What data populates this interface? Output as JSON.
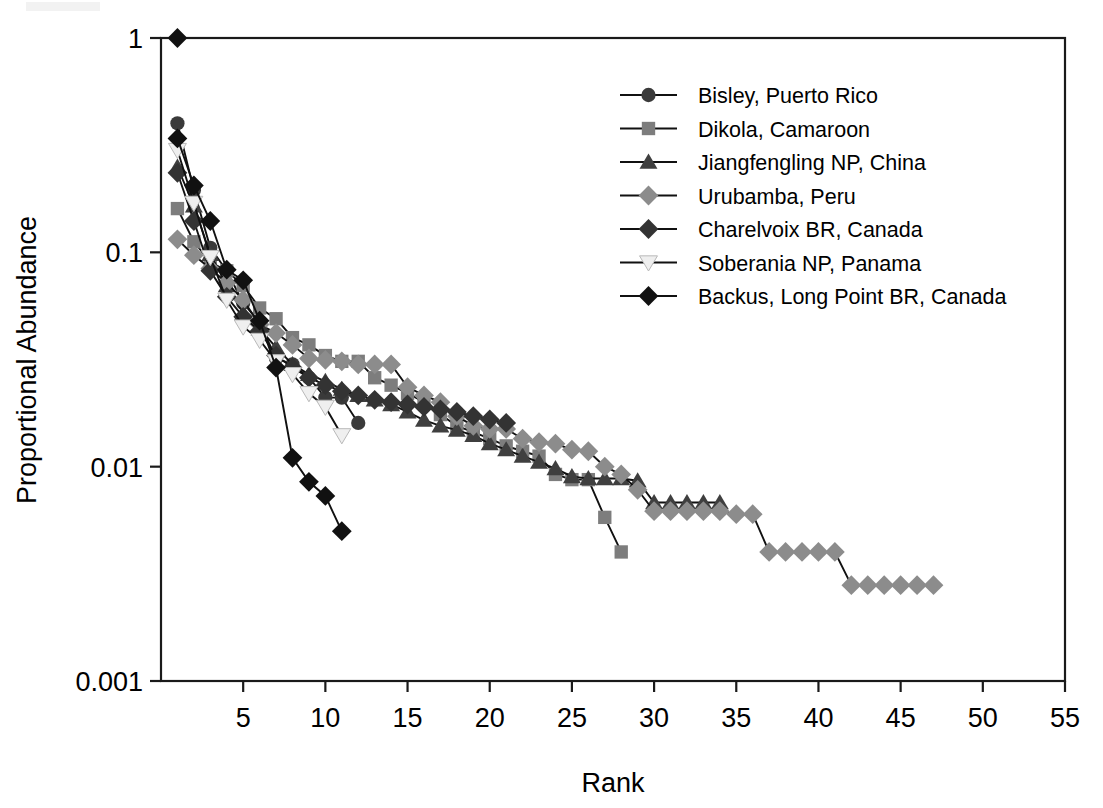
{
  "figure": {
    "width": 1103,
    "height": 808,
    "background": "#ffffff"
  },
  "axes": {
    "x": {
      "title": "Rank",
      "ticks": [
        5,
        10,
        15,
        20,
        25,
        30,
        35,
        40,
        45,
        50,
        55
      ],
      "tick_labels": [
        "5",
        "10",
        "15",
        "20",
        "25",
        "30",
        "35",
        "40",
        "45",
        "50",
        "55"
      ],
      "min": 0,
      "max": 55,
      "scale": "linear"
    },
    "y": {
      "title": "Proportional Abundance",
      "ticks": [
        1,
        0.1,
        0.01,
        0.001
      ],
      "tick_labels": [
        "1",
        "0.1",
        "0.01",
        "0.001"
      ],
      "min": 0.001,
      "max": 1,
      "scale": "log"
    },
    "grid": false,
    "frame": true,
    "frame_color": "#1a1a1a"
  },
  "legend": {
    "position": "top-right",
    "entries": [
      {
        "label": "Bisley, Puerto Rico",
        "marker": "circle",
        "color": "#3a3a3a"
      },
      {
        "label": "Dikola, Camaroon",
        "marker": "square",
        "color": "#7d7d7d"
      },
      {
        "label": "Jiangfengling NP, China",
        "marker": "triangle-up",
        "color": "#3f3f3f"
      },
      {
        "label": "Urubamba, Peru",
        "marker": "diamond",
        "color": "#8c8c8c"
      },
      {
        "label": "Charelvoix BR, Canada",
        "marker": "diamond",
        "color": "#333333"
      },
      {
        "label": "Soberania NP, Panama",
        "marker": "triangle-down",
        "color": "#efefef"
      },
      {
        "label": "Backus, Long Point BR, Canada",
        "marker": "diamond",
        "color": "#111111"
      }
    ]
  },
  "chart_data": {
    "type": "line",
    "title": "",
    "xlabel": "Rank",
    "ylabel": "Proportional Abundance",
    "xlim": [
      0,
      55
    ],
    "ylim": [
      0.001,
      1
    ],
    "yscale": "log",
    "grid": false,
    "legend_position": "top-right",
    "series": [
      {
        "name": "Bisley, Puerto Rico",
        "marker": "circle",
        "color": "#3a3a3a",
        "x": [
          1,
          2,
          3,
          4,
          5,
          6,
          7,
          8,
          9,
          10,
          11,
          12
        ],
        "values": [
          0.4,
          0.195,
          0.105,
          0.082,
          0.058,
          0.047,
          0.032,
          0.03,
          0.026,
          0.021,
          0.021,
          0.016
        ]
      },
      {
        "name": "Dikola, Camaroon",
        "marker": "square",
        "color": "#7d7d7d",
        "x": [
          1,
          2,
          3,
          4,
          5,
          6,
          7,
          8,
          9,
          10,
          11,
          12,
          13,
          14,
          15,
          16,
          17,
          18,
          19,
          20,
          21,
          22,
          23,
          24,
          25,
          26,
          27,
          28
        ],
        "values": [
          0.16,
          0.112,
          0.09,
          0.082,
          0.07,
          0.055,
          0.049,
          0.04,
          0.037,
          0.033,
          0.031,
          0.031,
          0.026,
          0.024,
          0.022,
          0.02,
          0.0175,
          0.0155,
          0.0145,
          0.0135,
          0.0125,
          0.0118,
          0.0112,
          0.0092,
          0.0087,
          0.0087,
          0.0058,
          0.004
        ]
      },
      {
        "name": "Jiangfengling NP, China",
        "marker": "triangle-up",
        "color": "#3f3f3f",
        "x": [
          1,
          2,
          3,
          4,
          5,
          6,
          7,
          8,
          9,
          10,
          11,
          12,
          13,
          14,
          15,
          16,
          17,
          18,
          19,
          20,
          21,
          22,
          23,
          24,
          25,
          26,
          27,
          28,
          29,
          30,
          31,
          32,
          33,
          34
        ],
        "values": [
          0.25,
          0.165,
          0.098,
          0.07,
          0.052,
          0.044,
          0.036,
          0.03,
          0.027,
          0.025,
          0.023,
          0.0215,
          0.0205,
          0.0195,
          0.018,
          0.0165,
          0.0155,
          0.0148,
          0.014,
          0.0128,
          0.012,
          0.0112,
          0.0105,
          0.0098,
          0.009,
          0.0088,
          0.0088,
          0.0088,
          0.0086,
          0.0068,
          0.0068,
          0.0068,
          0.0068,
          0.0068
        ]
      },
      {
        "name": "Urubamba, Peru",
        "marker": "diamond",
        "color": "#8c8c8c",
        "x": [
          1,
          2,
          3,
          4,
          5,
          6,
          7,
          8,
          9,
          10,
          11,
          12,
          13,
          14,
          15,
          16,
          17,
          18,
          19,
          20,
          21,
          22,
          23,
          24,
          25,
          26,
          27,
          28,
          29,
          30,
          31,
          32,
          33,
          34,
          35,
          36,
          37,
          38,
          39,
          40,
          41,
          42,
          43,
          44,
          45,
          46,
          47
        ],
        "values": [
          0.115,
          0.097,
          0.084,
          0.072,
          0.06,
          0.046,
          0.042,
          0.037,
          0.032,
          0.0315,
          0.031,
          0.03,
          0.03,
          0.03,
          0.0235,
          0.0215,
          0.02,
          0.0172,
          0.0155,
          0.015,
          0.015,
          0.0135,
          0.013,
          0.0128,
          0.012,
          0.0118,
          0.01,
          0.0092,
          0.0078,
          0.0062,
          0.0062,
          0.0062,
          0.0062,
          0.0062,
          0.006,
          0.006,
          0.004,
          0.004,
          0.004,
          0.004,
          0.004,
          0.0028,
          0.0028,
          0.0028,
          0.0028,
          0.0028,
          0.0028
        ]
      },
      {
        "name": "Charelvoix BR, Canada",
        "marker": "diamond",
        "color": "#333333",
        "x": [
          1,
          2,
          3,
          4,
          5,
          6,
          7,
          8,
          9,
          10,
          11,
          12,
          13,
          14,
          15,
          16,
          17,
          18,
          19,
          20,
          21
        ],
        "values": [
          0.235,
          0.14,
          0.082,
          0.062,
          0.05,
          0.043,
          0.033,
          0.029,
          0.026,
          0.024,
          0.0225,
          0.0215,
          0.0205,
          0.02,
          0.0195,
          0.019,
          0.0185,
          0.018,
          0.0172,
          0.0166,
          0.016
        ]
      },
      {
        "name": "Soberania NP, Panama",
        "marker": "triangle-down",
        "color": "#efefef",
        "x": [
          1,
          2,
          3,
          4,
          5,
          6,
          7,
          8,
          9,
          10,
          11
        ],
        "values": [
          0.3,
          0.17,
          0.095,
          0.06,
          0.045,
          0.039,
          0.031,
          0.027,
          0.022,
          0.019,
          0.014
        ]
      },
      {
        "name": "Backus, Long Point BR, Canada",
        "marker": "diamond",
        "color": "#111111",
        "x": [
          1,
          2,
          3,
          4,
          5,
          6,
          7,
          8,
          9,
          10,
          11
        ],
        "values": [
          0.34,
          0.205,
          0.14,
          0.083,
          0.074,
          0.048,
          0.029,
          0.011,
          0.0085,
          0.0073,
          0.005
        ]
      }
    ],
    "top_anchor": {
      "x": 1,
      "value": 1.0,
      "marker": "diamond",
      "color": "#111111",
      "note": "single point at rank 1, abundance 1 on frame corner"
    }
  }
}
